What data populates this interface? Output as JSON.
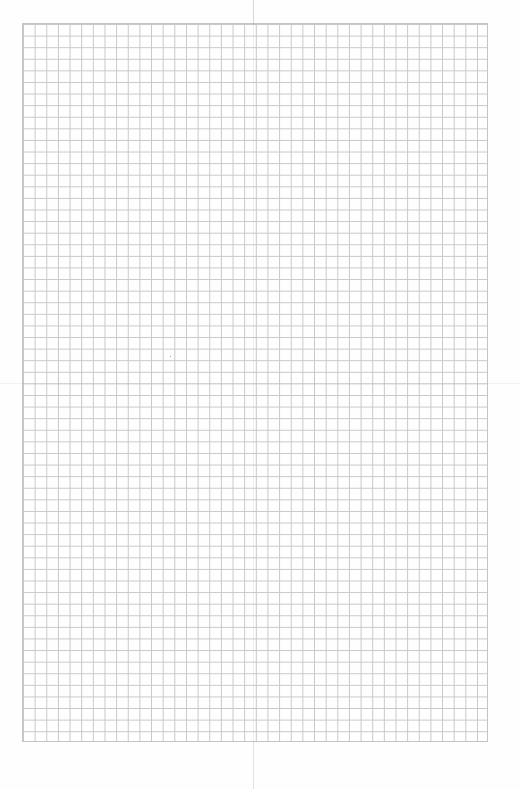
{
  "page": {
    "type": "grid-paper",
    "grid": {
      "columns": 40,
      "rows": 62,
      "line_color": "#c8c8c8",
      "background": "#fefefe"
    },
    "text": ""
  }
}
